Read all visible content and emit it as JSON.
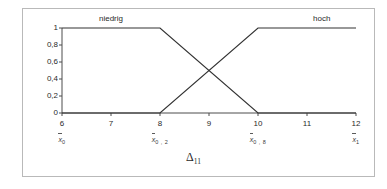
{
  "chart_data": {
    "type": "line",
    "title": "",
    "xlabel": "Δ",
    "xlabel_sub": "11",
    "ylabel": "Zugehörigkeitsgrad",
    "xlim": [
      6,
      12
    ],
    "ylim": [
      0,
      1
    ],
    "grid": false,
    "legend_position": "inline-above-plot",
    "x_ticks": [
      "6",
      "7",
      "8",
      "9",
      "10",
      "11",
      "12"
    ],
    "x_tick_values": [
      6,
      7,
      8,
      9,
      10,
      11,
      12
    ],
    "y_ticks": [
      "1",
      "0,8",
      "0,6",
      "0,4",
      "0,2",
      "0"
    ],
    "y_tick_values": [
      1,
      0.8,
      0.6,
      0.4,
      0.2,
      0
    ],
    "x_secondary_ticks": [
      {
        "at": 6,
        "symbol": "x",
        "sub": "0"
      },
      {
        "at": 8,
        "symbol": "x",
        "sub": "0 , 2"
      },
      {
        "at": 10,
        "symbol": "x",
        "sub": "0 , 8"
      },
      {
        "at": 12,
        "symbol": "x",
        "sub": "1"
      }
    ],
    "series": [
      {
        "name": "niedrig",
        "label_at_x": 7.0,
        "color": "#333333",
        "x": [
          6,
          8,
          10,
          12
        ],
        "values": [
          1,
          1,
          0,
          0
        ]
      },
      {
        "name": "hoch",
        "label_at_x": 11.3,
        "color": "#333333",
        "x": [
          6,
          8,
          10,
          12
        ],
        "values": [
          0,
          0,
          1,
          1
        ]
      }
    ],
    "annotations": [
      {
        "text": "crossing",
        "x": 9,
        "y": 0.5
      }
    ]
  },
  "colors": {
    "line": "#333333",
    "axis": "#4d4d4d",
    "frame": "#b9b9b9",
    "text": "#2a2a2a",
    "background": "#ffffff"
  }
}
